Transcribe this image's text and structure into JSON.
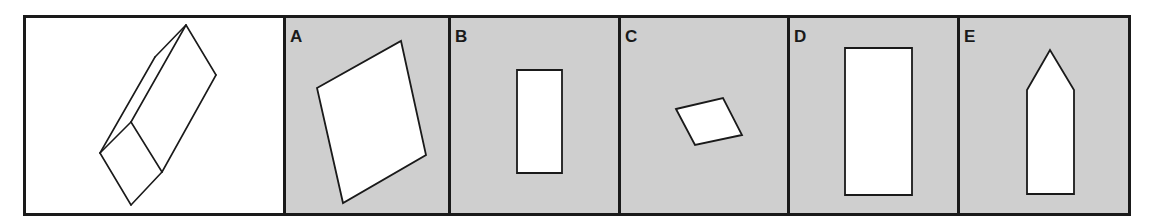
{
  "puzzle": {
    "type": "which view / cross-section of the 3D prism",
    "stimulus": {
      "description": "oblique rectangular prism (line drawing)",
      "edges": [
        [
          [
            186,
            25
          ],
          [
            216,
            75
          ]
        ],
        [
          [
            216,
            75
          ],
          [
            162,
            172
          ]
        ],
        [
          [
            162,
            172
          ],
          [
            131,
            205
          ]
        ],
        [
          [
            131,
            205
          ],
          [
            100,
            153
          ]
        ],
        [
          [
            100,
            153
          ],
          [
            131,
            122
          ]
        ],
        [
          [
            131,
            122
          ],
          [
            162,
            172
          ]
        ],
        [
          [
            131,
            122
          ],
          [
            186,
            25
          ]
        ],
        [
          [
            100,
            153
          ],
          [
            155,
            57
          ]
        ],
        [
          [
            155,
            57
          ],
          [
            186,
            25
          ]
        ]
      ]
    },
    "options": [
      {
        "label": "A",
        "shape": "parallelogram",
        "points": [
          [
            317,
            88
          ],
          [
            401,
            41
          ],
          [
            426,
            155
          ],
          [
            343,
            203
          ]
        ]
      },
      {
        "label": "B",
        "shape": "rectangle",
        "points": [
          [
            517,
            70
          ],
          [
            562,
            70
          ],
          [
            562,
            173
          ],
          [
            517,
            173
          ]
        ]
      },
      {
        "label": "C",
        "shape": "parallelogram",
        "points": [
          [
            676,
            109
          ],
          [
            723,
            98
          ],
          [
            742,
            135
          ],
          [
            695,
            145
          ]
        ]
      },
      {
        "label": "D",
        "shape": "rectangle",
        "points": [
          [
            845,
            48
          ],
          [
            912,
            48
          ],
          [
            912,
            195
          ],
          [
            845,
            195
          ]
        ]
      },
      {
        "label": "E",
        "shape": "pentagon",
        "points": [
          [
            1027,
            90
          ],
          [
            1050,
            50
          ],
          [
            1074,
            90
          ],
          [
            1074,
            194
          ],
          [
            1027,
            194
          ]
        ]
      }
    ]
  },
  "colors": {
    "frame": "#1a1a1a",
    "option_bg": "#cfcfcf",
    "shape_fill": "#ffffff",
    "stimulus_bg": "#ffffff"
  }
}
